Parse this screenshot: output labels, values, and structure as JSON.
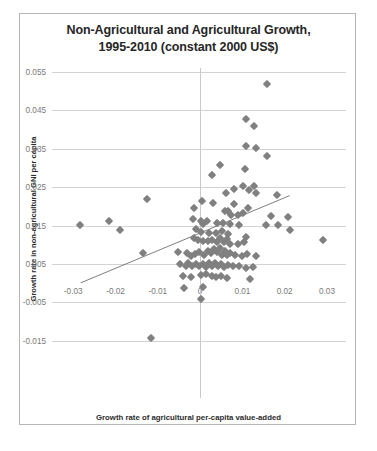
{
  "chart_data": {
    "type": "scatter",
    "title": "Non-Agricultural and Agricultural Growth, 1995-2010 (constant 2000 US$)",
    "title_lines": [
      "Non-Agricultural and Agricultural Growth,",
      "1995-2010 (constant 2000 US$)"
    ],
    "xlabel": "Growth rate of agricultural per-capita value-added",
    "ylabel": "Growth rate in non-agricultural GNI per capita",
    "xlim": [
      -0.035,
      0.0345
    ],
    "ylim": [
      -0.0195,
      0.055
    ],
    "xticks": [
      -0.03,
      -0.02,
      -0.01,
      0,
      0.01,
      0.02,
      0.03
    ],
    "xticklabels": [
      "-0.03",
      "-0.02",
      "-0.01",
      "0",
      "0.01",
      "0.02",
      "0.03"
    ],
    "yticks": [
      0.055,
      0.045,
      0.035,
      0.025,
      0.015,
      0.005,
      -0.005,
      -0.015
    ],
    "yticklabels": [
      "0.055",
      "0.045",
      "0.035",
      "0.025",
      "0.015",
      "0.005",
      "-0.005",
      "-0.015"
    ],
    "grid": "horizontal",
    "legend": "none",
    "marker": "diamond",
    "marker_color": "#808080",
    "marker_size": 6,
    "trendline": {
      "visible": true,
      "color": "#6f6f6f",
      "x_start": -0.0282,
      "y_start": 0.0001,
      "x_end": 0.0212,
      "y_end": 0.0228
    },
    "points": [
      [
        0.0158,
        0.0519
      ],
      [
        0.0108,
        0.0428
      ],
      [
        0.0128,
        0.041
      ],
      [
        0.0108,
        0.0358
      ],
      [
        0.0133,
        0.0351
      ],
      [
        0.0157,
        0.0332
      ],
      [
        0.0047,
        0.0308
      ],
      [
        0.0106,
        0.0298
      ],
      [
        0.0028,
        0.0282
      ],
      [
        0.0102,
        0.0252
      ],
      [
        0.0128,
        0.0252
      ],
      [
        0.0081,
        0.0245
      ],
      [
        0.0115,
        0.0244
      ],
      [
        0.0061,
        0.0236
      ],
      [
        0.0132,
        0.0235
      ],
      [
        0.0181,
        0.0231
      ],
      [
        -0.0125,
        0.0219
      ],
      [
        0.0005,
        0.0213
      ],
      [
        0.0031,
        0.0208
      ],
      [
        0.0079,
        0.0207
      ],
      [
        -0.0014,
        0.0197
      ],
      [
        0.0114,
        0.0196
      ],
      [
        0.0059,
        0.0189
      ],
      [
        0.0065,
        0.0187
      ],
      [
        0.0101,
        0.0183
      ],
      [
        0.0074,
        0.0178
      ],
      [
        0.009,
        0.0177
      ],
      [
        0.0168,
        0.0174
      ],
      [
        0.0207,
        0.0172
      ],
      [
        -0.0285,
        0.0151
      ],
      [
        -0.0215,
        0.0161
      ],
      [
        -0.0189,
        0.0139
      ],
      [
        -0.0016,
        0.0166
      ],
      [
        0.0001,
        0.0162
      ],
      [
        0.0017,
        0.0163
      ],
      [
        0.0008,
        0.0154
      ],
      [
        0.004,
        0.0158
      ],
      [
        0.0055,
        0.0157
      ],
      [
        0.0071,
        0.0154
      ],
      [
        0.0093,
        0.0152
      ],
      [
        0.0155,
        0.0152
      ],
      [
        0.0183,
        0.0152
      ],
      [
        0.0213,
        0.0139
      ],
      [
        -0.0009,
        0.0141
      ],
      [
        0.0002,
        0.0133
      ],
      [
        0.002,
        0.0131
      ],
      [
        0.0037,
        0.013
      ],
      [
        0.0052,
        0.0135
      ],
      [
        0.0066,
        0.0128
      ],
      [
        0.0108,
        0.012
      ],
      [
        0.029,
        0.0113
      ],
      [
        -0.0135,
        0.0078
      ],
      [
        -0.0052,
        0.008
      ],
      [
        -0.0014,
        0.0118
      ],
      [
        -0.0004,
        0.0112
      ],
      [
        0.0006,
        0.011
      ],
      [
        0.0019,
        0.0109
      ],
      [
        0.0029,
        0.0112
      ],
      [
        0.004,
        0.0106
      ],
      [
        0.0048,
        0.0118
      ],
      [
        0.0057,
        0.0107
      ],
      [
        0.0063,
        0.0116
      ],
      [
        0.007,
        0.0103
      ],
      [
        0.0089,
        0.0102
      ],
      [
        0.0104,
        0.0108
      ],
      [
        -0.0032,
        0.0078
      ],
      [
        -0.0021,
        0.007
      ],
      [
        -0.0012,
        0.0076
      ],
      [
        -0.0002,
        0.0081
      ],
      [
        0.0009,
        0.0074
      ],
      [
        0.0018,
        0.0084
      ],
      [
        0.0026,
        0.0079
      ],
      [
        0.0033,
        0.0088
      ],
      [
        0.0041,
        0.0082
      ],
      [
        0.0046,
        0.0091
      ],
      [
        0.0052,
        0.0074
      ],
      [
        0.0058,
        0.0084
      ],
      [
        0.0063,
        0.0073
      ],
      [
        0.0071,
        0.0079
      ],
      [
        0.0082,
        0.0074
      ],
      [
        0.0098,
        0.0072
      ],
      [
        0.0112,
        0.0076
      ],
      [
        0.0133,
        0.007
      ],
      [
        -0.0048,
        0.0049
      ],
      [
        -0.0034,
        0.0044
      ],
      [
        -0.0028,
        0.0052
      ],
      [
        -0.0019,
        0.0046
      ],
      [
        -0.001,
        0.0051
      ],
      [
        -0.0002,
        0.0044
      ],
      [
        0.0006,
        0.005
      ],
      [
        0.0014,
        0.0043
      ],
      [
        0.0022,
        0.0052
      ],
      [
        0.0029,
        0.0046
      ],
      [
        0.0036,
        0.0053
      ],
      [
        0.0042,
        0.0044
      ],
      [
        0.0049,
        0.0049
      ],
      [
        0.0056,
        0.0042
      ],
      [
        0.0065,
        0.0047
      ],
      [
        0.0078,
        0.0044
      ],
      [
        0.0092,
        0.0046
      ],
      [
        0.0108,
        0.004
      ],
      [
        0.0125,
        0.0042
      ],
      [
        -0.0041,
        0.0019
      ],
      [
        -0.0022,
        0.0016
      ],
      [
        0.0001,
        0.0021
      ],
      [
        0.0015,
        0.0024
      ],
      [
        0.0028,
        0.0018
      ],
      [
        0.0037,
        0.0015
      ],
      [
        0.005,
        0.0019
      ],
      [
        0.0063,
        0.0013
      ],
      [
        0.0118,
        0.001
      ],
      [
        -0.0038,
        -0.0012
      ],
      [
        0.0003,
        -0.004
      ],
      [
        0.0007,
        -0.001
      ],
      [
        -0.0115,
        -0.0143
      ]
    ]
  }
}
